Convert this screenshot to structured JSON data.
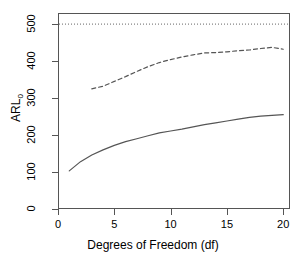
{
  "chart_data": {
    "type": "line",
    "title": "",
    "xlabel": "Degrees of Freedom (df)",
    "ylabel": "ARL0",
    "ylabel_base": "ARL",
    "ylabel_subscript": "0",
    "xlim": [
      0,
      20.6
    ],
    "ylim": [
      0,
      530
    ],
    "xticks": [
      0,
      5,
      10,
      15,
      20
    ],
    "xticklabels": [
      "0",
      "5",
      "10",
      "15",
      "20"
    ],
    "yticks": [
      0,
      100,
      200,
      300,
      400,
      500
    ],
    "yticklabels": [
      "0",
      "100",
      "200",
      "300",
      "400",
      "500"
    ],
    "grid": false,
    "legend": "none",
    "box": true,
    "series": [
      {
        "name": "lower-curve",
        "style": "solid",
        "color": "#555555",
        "linewidth": 1.2,
        "x": [
          1,
          2,
          3,
          4,
          5,
          6,
          7,
          8,
          9,
          10,
          11,
          12,
          13,
          14,
          15,
          16,
          17,
          18,
          19,
          20
        ],
        "y": [
          103,
          128,
          146,
          160,
          172,
          182,
          190,
          198,
          206,
          211,
          216,
          222,
          228,
          233,
          238,
          243,
          248,
          251,
          253,
          255
        ]
      },
      {
        "name": "upper-curve",
        "style": "dashed",
        "color": "#555555",
        "linewidth": 1.2,
        "x": [
          3,
          4,
          5,
          6,
          7,
          8,
          9,
          10,
          11,
          12,
          13,
          14,
          15,
          16,
          17,
          18,
          19,
          20
        ],
        "y": [
          325,
          332,
          345,
          358,
          372,
          385,
          396,
          404,
          411,
          417,
          422,
          423,
          425,
          428,
          430,
          434,
          437,
          432
        ]
      }
    ],
    "reference_lines": [
      {
        "name": "nominal-arl-line",
        "orientation": "horizontal",
        "value": 500,
        "style": "dotted",
        "color": "#666666"
      }
    ]
  }
}
